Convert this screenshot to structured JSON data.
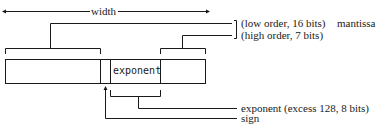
{
  "diagram": {
    "width_label": "width",
    "fields": [
      {
        "id": "mantissa-low",
        "label": ""
      },
      {
        "id": "sign",
        "label": ""
      },
      {
        "id": "exponent",
        "label": "exponent"
      },
      {
        "id": "mantissa-high",
        "label": ""
      }
    ],
    "annotations": {
      "low_order": "(low order, 16 bits)",
      "mantissa": "mantissa",
      "high_order": "(high order, 7 bits)",
      "exponent": "exponent (excess 128, 8 bits)",
      "sign": "sign"
    },
    "colors": {
      "line": "#1a1a1a",
      "background": "#ffffff"
    }
  }
}
